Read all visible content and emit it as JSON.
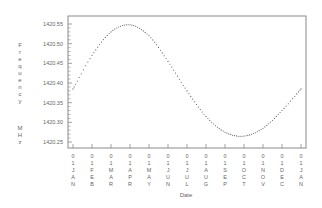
{
  "chart_data": {
    "type": "line",
    "title": "",
    "xlabel": "Date",
    "ylabel": "Frequency MHz",
    "ylabel_lines": [
      "Frequency",
      "MHz"
    ],
    "ylim": [
      1420.25,
      1420.55
    ],
    "yticks": [
      "1420.55",
      "1420.50",
      "1420.45",
      "1420.40",
      "1420.35",
      "1420.30",
      "1420.25"
    ],
    "ytick_values": [
      1420.55,
      1420.5,
      1420.45,
      1420.4,
      1420.35,
      1420.3,
      1420.25
    ],
    "categories": [
      "01 JAN",
      "01 FEB",
      "01 MAR",
      "01 APR",
      "01 MAY",
      "01 JUN",
      "01 JUL",
      "01 AUG",
      "01 SEP",
      "01 OCT",
      "01 NOV",
      "01 DEC",
      "01 JAN"
    ],
    "xtick_stacked": [
      "01JAN",
      "01FEB",
      "01MAR",
      "01APR",
      "01MAY",
      "01JUN",
      "01JUL",
      "01AUG",
      "01SEP",
      "01OCT",
      "01NOV",
      "01DEC",
      "01JAN"
    ],
    "grid": false,
    "legend": null,
    "series": [
      {
        "name": "Frequency",
        "style": "dotted",
        "color": "#555555",
        "values": [
          1420.385,
          1420.47,
          1420.53,
          1420.548,
          1420.52,
          1420.455,
          1420.38,
          1420.315,
          1420.275,
          1420.265,
          1420.285,
          1420.33,
          1420.385
        ]
      }
    ],
    "peak": {
      "date": "01 APR",
      "value": 1420.548
    },
    "trough": {
      "date": "~07 OCT",
      "value": 1420.265
    }
  },
  "colors": {
    "axis": "#888888",
    "line": "#555555",
    "text": "#666666",
    "background": "#ffffff"
  }
}
